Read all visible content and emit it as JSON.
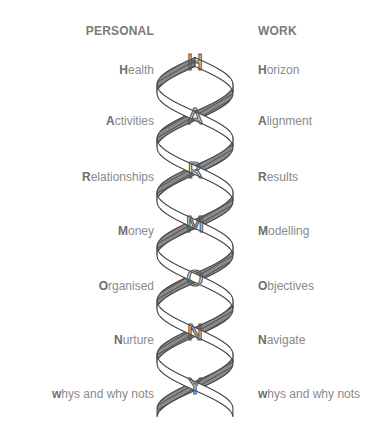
{
  "title_letters": [
    "H",
    "A",
    "R",
    "M",
    "O",
    "N",
    "Y"
  ],
  "personal": {
    "heading": "PERSONAL",
    "items": [
      {
        "initial": "H",
        "rest": "ealth"
      },
      {
        "initial": "A",
        "rest": "ctivities"
      },
      {
        "initial": "R",
        "rest": "elationships"
      },
      {
        "initial": "M",
        "rest": "oney"
      },
      {
        "initial": "O",
        "rest": "rganised"
      },
      {
        "initial": "N",
        "rest": "urture"
      },
      {
        "initial": "w",
        "rest": "hys and why nots"
      }
    ]
  },
  "work": {
    "heading": "WORK",
    "items": [
      {
        "initial": "H",
        "rest": "orizon"
      },
      {
        "initial": "A",
        "rest": "lignment"
      },
      {
        "initial": "R",
        "rest": "esults"
      },
      {
        "initial": "M",
        "rest": "odelling"
      },
      {
        "initial": "O",
        "rest": "bjectives"
      },
      {
        "initial": "N",
        "rest": "avigate"
      },
      {
        "initial": "w",
        "rest": "hys and why nots"
      }
    ]
  },
  "colors": {
    "text": "#8a8a8a",
    "initial": "#6e6e6e",
    "ribbon_shade": "#6a6a6a",
    "ribbon_outline": "#444444"
  }
}
